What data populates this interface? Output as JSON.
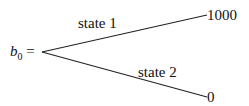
{
  "root": {
    "var": "b",
    "sub": "0",
    "eq": "="
  },
  "branches": [
    {
      "label": "state 1",
      "value": "1000"
    },
    {
      "label": "state 2",
      "value": "0"
    }
  ]
}
